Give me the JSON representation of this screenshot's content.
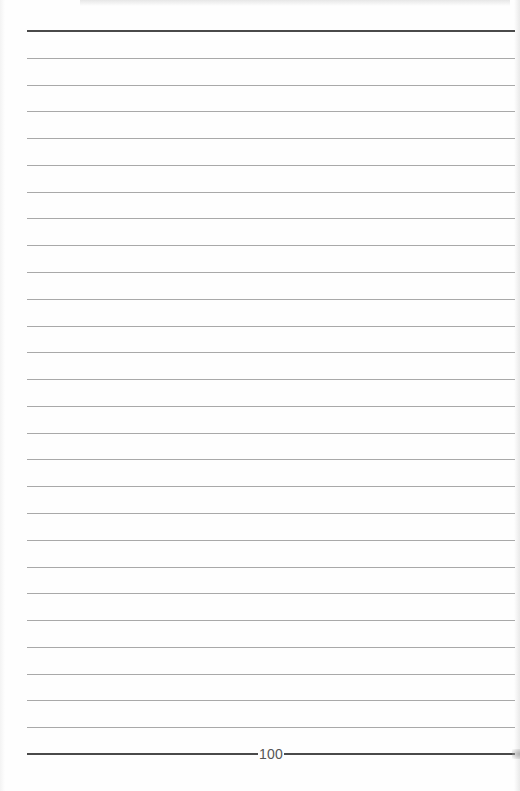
{
  "page": {
    "type": "ruled-notebook-page",
    "page_number": "100",
    "ruled_line_count": 26,
    "colors": {
      "background": "#fefefe",
      "thin_rule": "#a9a9a9",
      "thick_rule": "#4a4a4a",
      "page_number_text": "#555555"
    }
  }
}
